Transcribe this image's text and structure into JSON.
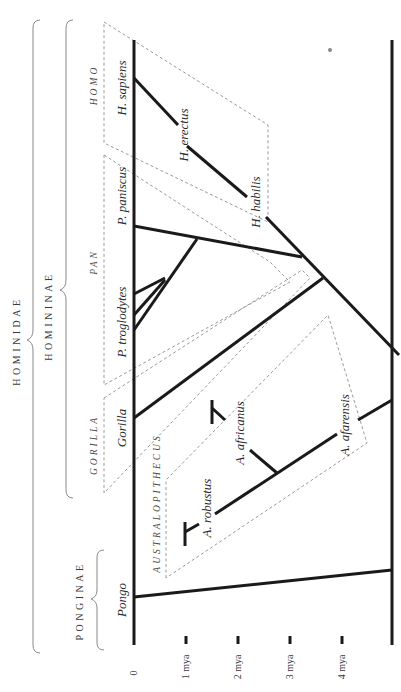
{
  "diagram": {
    "orientation": "rotated 90° counter-clockwise",
    "colors": {
      "branch": "#1a1a1a",
      "group_box": "#9a9a9a",
      "brace": "#8a8a8a",
      "text": "#2a2a2a"
    },
    "taxa": {
      "family": "HOMINIDAE",
      "subfamily_1": "HOMININAE",
      "subfamily_2": "PONGINAE"
    },
    "genera": {
      "homo": "HOMO",
      "pan": "PAN",
      "gorilla": "GORILLA",
      "australopithecus": "AUSTRALOPITHECUS"
    },
    "species": {
      "h_sapiens": "H. sapiens",
      "h_erectus": "H. erectus",
      "h_habilis": "H. habilis",
      "p_paniscus": "P. paniscus",
      "p_troglodytes": "P. troglodytes",
      "gorilla": "Gorilla",
      "a_africanus": "A. africanus",
      "a_robustus": "A. robustus",
      "a_afarensis": "A. afarensis",
      "pongo": "Pongo"
    },
    "time_axis": {
      "labels": [
        "0",
        "1 mya",
        "2 mya",
        "3 mya",
        "4 mya"
      ]
    }
  }
}
